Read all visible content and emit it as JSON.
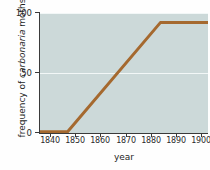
{
  "chart_data": {
    "type": "line",
    "title": "",
    "xlabel": "year",
    "ylabel_prefix": "frequency of ",
    "ylabel_species": "carbonaria",
    "ylabel_suffix": " moths",
    "xlim": [
      1836,
      1903
    ],
    "ylim": [
      0,
      100
    ],
    "xticks": [
      "1840",
      "1850",
      "1860",
      "1870",
      "1880",
      "1890",
      "1900"
    ],
    "xtick_values": [
      1840,
      1850,
      1860,
      1870,
      1880,
      1890,
      1900
    ],
    "yticks": [
      "0",
      "50",
      "100"
    ],
    "ytick_values": [
      0,
      50,
      100
    ],
    "grid": "horizontal-white",
    "legend": "none",
    "series": [
      {
        "name": "frequency of carbonaria moths",
        "color": "#a5692f",
        "x": [
          1836,
          1847,
          1884,
          1903
        ],
        "values": [
          1,
          1,
          92,
          92
        ]
      }
    ],
    "plot_background": "#ccd9d9",
    "axis_color": "#3a3a3a",
    "gridline_color": "#f2f7f7"
  }
}
